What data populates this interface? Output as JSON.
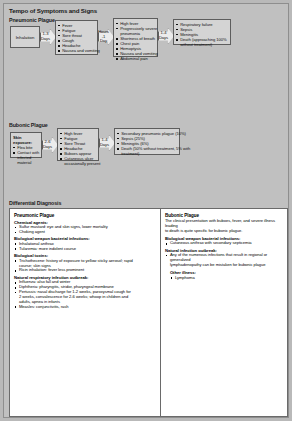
{
  "title": "Tempo of Symptoms and Signs",
  "rows": {
    "pneumonic": {
      "title": "Pneumonic Plague",
      "start": {
        "label": "Inhalation"
      },
      "arrows": [
        {
          "line1": "1-3",
          "line2": "Days"
        },
        {
          "line1": "Hours",
          "line2": "-1 Day"
        },
        {
          "line1": "1-4",
          "line2": "Days"
        }
      ],
      "stage1": [
        "Fever",
        "Fatigue",
        "Sore throat",
        "Cough",
        "Headache",
        "Nausea and vomiting"
      ],
      "stage2": [
        "High fever",
        "Progressively severe",
        "pneumonia",
        "Shortness of breath",
        "Chest pain",
        "Hemoptysis",
        "Nausea and vomiting",
        "Abdominal pain"
      ],
      "stage3": [
        "Respiratory failure",
        "Sepsis",
        "Meningitis",
        "Death (approaching 100%",
        "without treatment)"
      ]
    },
    "bubonic": {
      "title": "Bubonic Plague",
      "start": {
        "label": "Skin exposure:",
        "items": [
          "Flea bite",
          "Contact with",
          "infected",
          "material"
        ]
      },
      "arrows": [
        {
          "line1": "2-6",
          "line2": "Days"
        },
        {
          "line1": "1-4",
          "line2": "Days"
        }
      ],
      "stage1": [
        "High fever",
        "Fatigue",
        "Sore Throat",
        "Headache",
        "Buboes appear",
        "Cutaneous ulcer",
        "occasionally present"
      ],
      "stage2": [
        "Secondary pneumonic plague (10%)",
        "Sepsis (25%)",
        "Meningitis (6%)",
        "Death (50% without treatment, 5% with",
        "treatment)"
      ]
    }
  },
  "differential": {
    "title": "Differential Diagnosis",
    "pneumonic": {
      "heading": "Pneumonic Plague",
      "chemical_heading": "Chemical agents:",
      "chemical_items": [
        "Sulfur mustard: eye and skin signs, lower mortality",
        "Choking agent"
      ],
      "bio_bacterial_heading": "Biological weapon bacterial infections:",
      "bio_bacterial_items": [
        "Inhalational anthrax",
        "Tularemia: more indolent course"
      ],
      "bio_toxins_heading": "Biological toxins:",
      "bio_toxins_items": [
        "Trichothecene: history of exposure to yellow sticky aerosol; rapid",
        "course; skin signs",
        "Ricin inhalation: fever less prominent"
      ],
      "natural_heading": "Natural respiratory infection outbreak:",
      "natural_items": [
        "Influenza: also fall and winter",
        "Diphtheria: pharyngitis, stridor, pharyngeal membrane",
        "Pertussis: nasal discharge for 1-2 weeks, paroxysmal cough for",
        "2 weeks, convalescence for 2-6 weeks; whoop in children and",
        "adults, apnea in infants",
        "Measles: conjunctivitis, rash"
      ]
    },
    "bubonic": {
      "heading": "Bubonic Plague",
      "intro": [
        "The clinical presentation with buboes, fever, and severe illness leading",
        "to death is quite specific for bubonic plague."
      ],
      "bio_bacterial_heading": "Biological weapon bacterial infections:",
      "bio_bacterial_items": [
        "Cutaneous anthrax with secondary septicemia"
      ],
      "natural_heading": "Natural infection outbreak:",
      "natural_items": [
        "Any of the numerous infections that result in regional or generalized",
        "lymphadenopathy can be mistaken for bubonic plague"
      ],
      "other_heading": "Other illness:",
      "other_items": [
        "Lymphoma"
      ]
    }
  }
}
